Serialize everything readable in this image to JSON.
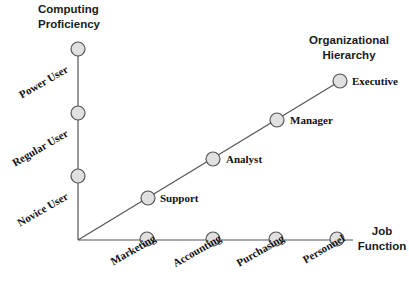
{
  "diagram": {
    "kind": "three-axis-star-schema-diagram",
    "background_color": "#ffffff",
    "node_fill_color": "#e0e0e0",
    "node_stroke_color": "#555555",
    "axis_line_color": "#555555",
    "origin": {
      "x": 78,
      "y": 240
    }
  },
  "axes": [
    {
      "id": "computing-proficiency",
      "title": "Computing\nProficiency",
      "direction": "vertical",
      "nodes": [
        {
          "label": "Power User",
          "x": 78,
          "y": 49
        },
        {
          "label": "Regular User",
          "x": 78,
          "y": 113
        },
        {
          "label": "Novice User",
          "x": 78,
          "y": 176
        }
      ]
    },
    {
      "id": "organizational-hierarchy",
      "title": "Organizational\nHierarchy",
      "direction": "diagonal",
      "nodes": [
        {
          "label": "Support",
          "x": 148,
          "y": 198
        },
        {
          "label": "Analyst",
          "x": 213,
          "y": 159
        },
        {
          "label": "Manager",
          "x": 277,
          "y": 120
        },
        {
          "label": "Executive",
          "x": 340,
          "y": 81
        }
      ]
    },
    {
      "id": "job-function",
      "title": "Job\nFunction",
      "direction": "horizontal",
      "nodes": [
        {
          "label": "Marketing",
          "x": 147,
          "y": 239
        },
        {
          "label": "Accounting",
          "x": 213,
          "y": 239
        },
        {
          "label": "Purchasing",
          "x": 276,
          "y": 239
        },
        {
          "label": "Personnel",
          "x": 337,
          "y": 239
        }
      ]
    }
  ],
  "labels": {
    "power_user": "Power User",
    "regular_user": "Regular User",
    "novice_user": "Novice User",
    "support": "Support",
    "analyst": "Analyst",
    "manager": "Manager",
    "executive": "Executive",
    "marketing": "Marketing",
    "accounting": "Accounting",
    "purchasing": "Purchasing",
    "personnel": "Personnel"
  },
  "titles": {
    "computing_proficiency": "Computing\nProficiency",
    "organizational_hierarchy": "Organizational\nHierarchy",
    "job_function": "Job\nFunction"
  }
}
